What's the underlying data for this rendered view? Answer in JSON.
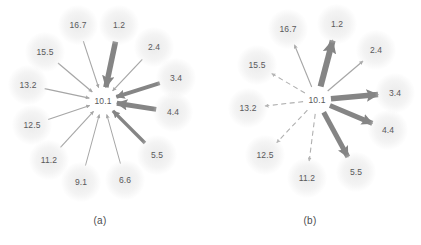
{
  "figure": {
    "background_color": "#ffffff",
    "label_color": "#59595b",
    "thick_arrow_color": "#858585",
    "thin_arrow_color": "#a6a6a6",
    "dashed_arrow_color": "#b0b0b0",
    "halo_color": "#e8e8e8"
  },
  "panels": [
    {
      "id": "a",
      "caption": "(a)",
      "caption_x": 100,
      "caption_y": 215,
      "center": {
        "label": "10.1",
        "x": 103,
        "y": 101
      },
      "description": "all arrows point inward toward the center node",
      "nodes": [
        {
          "label": "1.2",
          "x": 119,
          "y": 25,
          "style": "thick",
          "direction": "inward",
          "weight": 5.5
        },
        {
          "label": "2.4",
          "x": 154,
          "y": 47,
          "style": "thin",
          "direction": "inward",
          "weight": 1.2
        },
        {
          "label": "3.4",
          "x": 176,
          "y": 78,
          "style": "thick",
          "direction": "inward",
          "weight": 4.0
        },
        {
          "label": "4.4",
          "x": 173,
          "y": 112,
          "style": "thick",
          "direction": "inward",
          "weight": 5.0
        },
        {
          "label": "5.5",
          "x": 157,
          "y": 155,
          "style": "thick",
          "direction": "inward",
          "weight": 3.4
        },
        {
          "label": "6.6",
          "x": 125,
          "y": 180,
          "style": "thin",
          "direction": "inward",
          "weight": 1.0
        },
        {
          "label": "9.1",
          "x": 81,
          "y": 182,
          "style": "thin",
          "direction": "inward",
          "weight": 1.0
        },
        {
          "label": "11.2",
          "x": 49,
          "y": 160,
          "style": "thin",
          "direction": "inward",
          "weight": 1.1
        },
        {
          "label": "12.5",
          "x": 32,
          "y": 125,
          "style": "thin",
          "direction": "inward",
          "weight": 1.1
        },
        {
          "label": "13.2",
          "x": 28,
          "y": 85,
          "style": "thin",
          "direction": "inward",
          "weight": 1.2
        },
        {
          "label": "15.5",
          "x": 45,
          "y": 52,
          "style": "thin",
          "direction": "inward",
          "weight": 1.2
        },
        {
          "label": "16.7",
          "x": 78,
          "y": 25,
          "style": "thin",
          "direction": "inward",
          "weight": 1.1
        }
      ]
    },
    {
      "id": "b",
      "caption": "(b)",
      "caption_x": 100,
      "caption_y": 215,
      "center": {
        "label": "10.1",
        "x": 107,
        "y": 100
      },
      "description": "all arrows point outward from the center node; left half dashed",
      "nodes": [
        {
          "label": "1.2",
          "x": 127,
          "y": 24,
          "style": "thick",
          "direction": "outward",
          "weight": 6.0
        },
        {
          "label": "2.4",
          "x": 166,
          "y": 50,
          "style": "thin",
          "direction": "outward",
          "weight": 1.2
        },
        {
          "label": "3.4",
          "x": 185,
          "y": 93,
          "style": "thick",
          "direction": "outward",
          "weight": 5.5
        },
        {
          "label": "4.4",
          "x": 178,
          "y": 130,
          "style": "thick",
          "direction": "outward",
          "weight": 5.0
        },
        {
          "label": "5.5",
          "x": 146,
          "y": 172,
          "style": "thick",
          "direction": "outward",
          "weight": 5.0
        },
        {
          "label": "11.2",
          "x": 97,
          "y": 178,
          "style": "dashed",
          "direction": "outward",
          "weight": 1.1
        },
        {
          "label": "12.5",
          "x": 55,
          "y": 155,
          "style": "dashed",
          "direction": "outward",
          "weight": 1.1
        },
        {
          "label": "13.2",
          "x": 38,
          "y": 108,
          "style": "dashed",
          "direction": "outward",
          "weight": 1.1
        },
        {
          "label": "15.5",
          "x": 47,
          "y": 65,
          "style": "dashed",
          "direction": "outward",
          "weight": 1.1
        },
        {
          "label": "16.7",
          "x": 78,
          "y": 29,
          "style": "thin",
          "direction": "outward",
          "weight": 1.1
        }
      ]
    }
  ]
}
